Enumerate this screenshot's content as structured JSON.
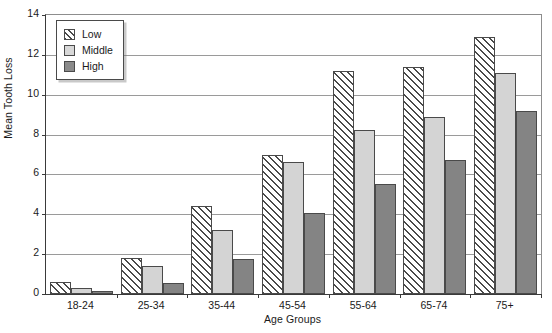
{
  "chart_data": {
    "type": "bar",
    "title": "",
    "xlabel": "Age Groups",
    "ylabel": "Mean Tooth Loss",
    "categories": [
      "18-24",
      "25-34",
      "35-44",
      "45-54",
      "55-64",
      "65-74",
      "75+"
    ],
    "ylim": [
      0,
      14
    ],
    "ytick_labels": [
      "0",
      "2",
      "4",
      "6",
      "8",
      "10",
      "12",
      "14"
    ],
    "ytick_values": [
      0,
      2,
      4,
      6,
      8,
      10,
      12,
      14
    ],
    "grid": true,
    "legend_position": "upper-left-inside",
    "series": [
      {
        "name": "Low",
        "pattern": "diagonal-hatch",
        "color": "#ffffff",
        "values": [
          0.6,
          1.8,
          4.4,
          7.0,
          11.2,
          11.4,
          12.9
        ]
      },
      {
        "name": "Middle",
        "pattern": "solid",
        "color": "#d4d4d4",
        "values": [
          0.3,
          1.4,
          3.2,
          6.6,
          8.25,
          8.9,
          11.1
        ]
      },
      {
        "name": "High",
        "pattern": "solid",
        "color": "#848484",
        "values": [
          0.15,
          0.55,
          1.75,
          4.05,
          5.5,
          6.7,
          9.2
        ]
      }
    ]
  },
  "legend": {
    "items": [
      {
        "label": "Low"
      },
      {
        "label": "Middle"
      },
      {
        "label": "High"
      }
    ]
  }
}
